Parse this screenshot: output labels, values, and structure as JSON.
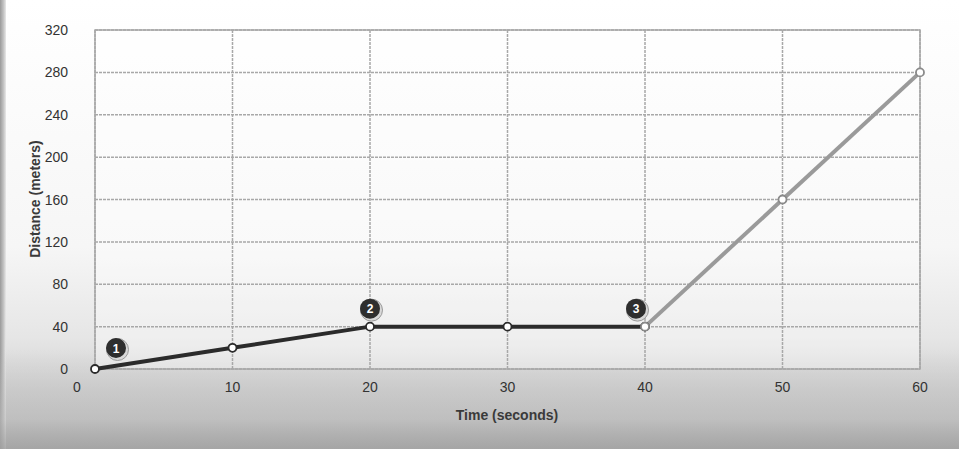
{
  "chart_data": {
    "type": "line",
    "title": "",
    "xlabel": "Time (seconds)",
    "ylabel": "Distance (meters)",
    "xlim": [
      0,
      60
    ],
    "ylim": [
      0,
      320
    ],
    "x_ticks": [
      0,
      10,
      20,
      30,
      40,
      50,
      60
    ],
    "y_ticks": [
      0,
      40,
      80,
      120,
      160,
      200,
      240,
      280,
      320
    ],
    "grid": true,
    "legend": null,
    "series": [
      {
        "name": "segment-1-2-3",
        "color": "#2b2b2b",
        "x": [
          0,
          10,
          20,
          30,
          40
        ],
        "y": [
          0,
          20,
          40,
          40,
          40
        ]
      },
      {
        "name": "segment-after-3",
        "color": "#9a9a9a",
        "x": [
          40,
          50,
          60
        ],
        "y": [
          40,
          160,
          280
        ]
      }
    ],
    "annotations": [
      {
        "label": "1",
        "x": 0,
        "y": 0
      },
      {
        "label": "2",
        "x": 20,
        "y": 40
      },
      {
        "label": "3",
        "x": 40,
        "y": 40
      }
    ]
  },
  "axes": {
    "x_label": "Time (seconds)",
    "y_label": "Distance (meters)"
  },
  "colors": {
    "grid": "#a8a8a8",
    "dark_line": "#2b2b2b",
    "light_line": "#9a9a9a",
    "marker_badge": "#2e2e2e"
  }
}
